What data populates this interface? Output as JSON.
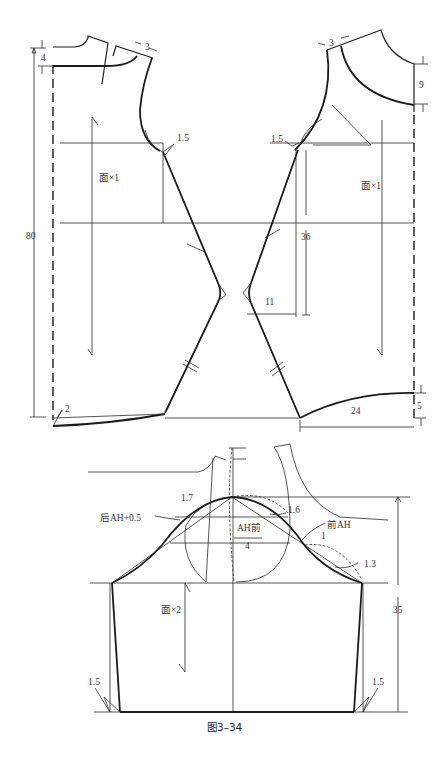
{
  "figure": {
    "caption": "图3–34",
    "type": "garment-pattern-diagram"
  },
  "body_pattern": {
    "back_piece": {
      "grain_label": "面×1",
      "labels": {
        "neck_depth": "4",
        "shoulder_offset": "3",
        "armhole_offset": "1.5",
        "total_length": "80",
        "hem_drop": "2"
      }
    },
    "front_piece": {
      "grain_label": "面×1",
      "labels": {
        "shoulder_offset": "3",
        "neck_depth": "9",
        "armhole_offset": "1.5",
        "waist_height": "36",
        "waist_suppression": "11",
        "hem_width": "24",
        "hem_rise": "5"
      }
    }
  },
  "sleeve_pattern": {
    "grain_label": "面×2",
    "labels": {
      "back_curve": "后AH+0.5",
      "front_curve": "前AH",
      "cap_formula_numerator": "AH前",
      "cap_formula_denominator": "4",
      "back_cap_raise": "1.7",
      "front_cap_raise": "1.6",
      "front_crossing": "1",
      "front_hollow": "1.3",
      "sleeve_length": "35",
      "left_hem": "1.5",
      "right_hem": "1.5"
    }
  }
}
